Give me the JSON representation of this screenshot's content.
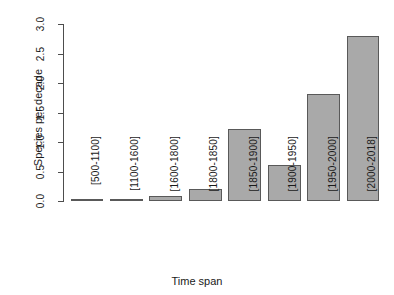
{
  "chart_data": {
    "type": "bar",
    "title": "",
    "xlabel": "Time span",
    "ylabel": "Species per decade",
    "categories": [
      "[500-1100]",
      "[1100-1600]",
      "[1600-1800]",
      "[1800-1850]",
      "[1850-1900]",
      "[1900-1950]",
      "[1950-2000]",
      "[2000-2018]"
    ],
    "values": [
      0.01,
      0.02,
      0.08,
      0.2,
      1.22,
      0.61,
      1.81,
      2.8
    ],
    "ylim": [
      0.0,
      3.0
    ],
    "yticks": [
      "0.0",
      "0.5",
      "1.0",
      "1.5",
      "2.0",
      "2.5",
      "3.0"
    ],
    "ytick_values": [
      0.0,
      0.5,
      1.0,
      1.5,
      2.0,
      2.5,
      3.0
    ],
    "grid": false,
    "legend": null,
    "bar_fill_color": "#a9a9a9",
    "bar_border_color": "#595959",
    "background_color": "#ffffff",
    "axis_color": "#4d4d4d"
  }
}
